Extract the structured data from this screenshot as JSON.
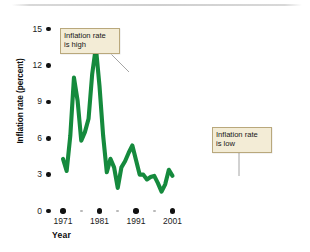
{
  "chart_data": {
    "type": "line",
    "title": "",
    "xlabel": "Year",
    "ylabel": "Inflation rate (percent)",
    "xlim": [
      1971,
      2001
    ],
    "ylim": [
      0,
      15
    ],
    "grid": false,
    "legend": null,
    "line_color": "#158a3d",
    "x_tick_labels": [
      "1971",
      "1981",
      "1991",
      "2001"
    ],
    "x_tick_values": [
      1971,
      1981,
      1991,
      2001
    ],
    "x_minor_tick_values": [
      1976,
      1986,
      1996
    ],
    "y_tick_labels": [
      "0",
      "3",
      "6",
      "9",
      "12",
      "15"
    ],
    "y_tick_values": [
      0,
      3,
      6,
      9,
      12,
      15
    ],
    "series": [
      {
        "name": "Inflation rate",
        "x": [
          1971,
          1972,
          1973,
          1974,
          1975,
          1976,
          1977,
          1978,
          1979,
          1980,
          1981,
          1982,
          1983,
          1984,
          1985,
          1986,
          1987,
          1988,
          1989,
          1990,
          1991,
          1992,
          1993,
          1994,
          1995,
          1996,
          1997,
          1998,
          1999,
          2000,
          2001
        ],
        "values": [
          4.3,
          3.3,
          6.2,
          11.0,
          9.1,
          5.8,
          6.5,
          7.6,
          11.3,
          13.5,
          10.3,
          6.2,
          3.2,
          4.3,
          3.6,
          1.9,
          3.6,
          4.1,
          4.8,
          5.4,
          4.2,
          3.0,
          3.0,
          2.6,
          2.8,
          2.9,
          2.3,
          1.6,
          2.2,
          3.4,
          2.9
        ]
      }
    ],
    "annotations": [
      {
        "id": "high",
        "text": "Inflation rate\nis high",
        "points_to_x": 1980,
        "points_to_y": 13.5
      },
      {
        "id": "low",
        "text": "Inflation rate\nis low",
        "points_to_x": 1998,
        "points_to_y": 1.6
      }
    ]
  },
  "axis": {
    "y_title": "Inflation rate (percent)",
    "x_title": "Year"
  },
  "callouts": {
    "high": "Inflation rate\nis high",
    "low": "Inflation rate\nis low"
  }
}
